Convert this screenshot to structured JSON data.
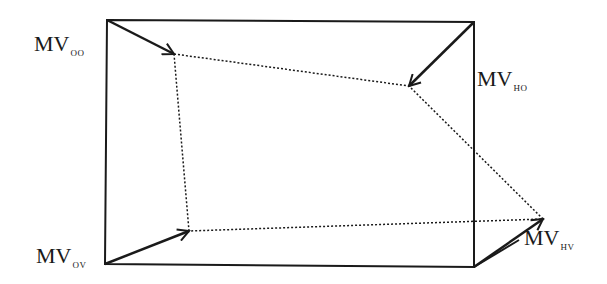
{
  "diagram": {
    "type": "motion-vector-interpolation",
    "colors": {
      "stroke": "#1a1a1a",
      "background": "#ffffff"
    },
    "frame": {
      "top_left": [
        107,
        20
      ],
      "top_right": [
        474,
        22
      ],
      "bottom_right": [
        474,
        267
      ],
      "bottom_left": [
        105,
        264
      ],
      "extra_edge_from": [
        474,
        267
      ],
      "extra_edge_to": [
        519,
        240
      ]
    },
    "vectors": [
      {
        "id": "oo",
        "from": [
          107,
          20
        ],
        "to": [
          174,
          54
        ]
      },
      {
        "id": "ho",
        "from": [
          474,
          22
        ],
        "to": [
          409,
          86
        ]
      },
      {
        "id": "ov",
        "from": [
          105,
          264
        ],
        "to": [
          189,
          231
        ]
      },
      {
        "id": "hv",
        "from": [
          474,
          267
        ],
        "to": [
          543,
          219
        ]
      }
    ],
    "dotted_quad": [
      [
        174,
        54
      ],
      [
        409,
        86
      ],
      [
        543,
        219
      ],
      [
        189,
        231
      ]
    ],
    "labels": {
      "oo": {
        "main": "MV",
        "sub": "OO"
      },
      "ho": {
        "main": "MV",
        "sub": "HO"
      },
      "ov": {
        "main": "MV",
        "sub": "OV"
      },
      "hv": {
        "main": "MV",
        "sub": "HV"
      }
    }
  }
}
